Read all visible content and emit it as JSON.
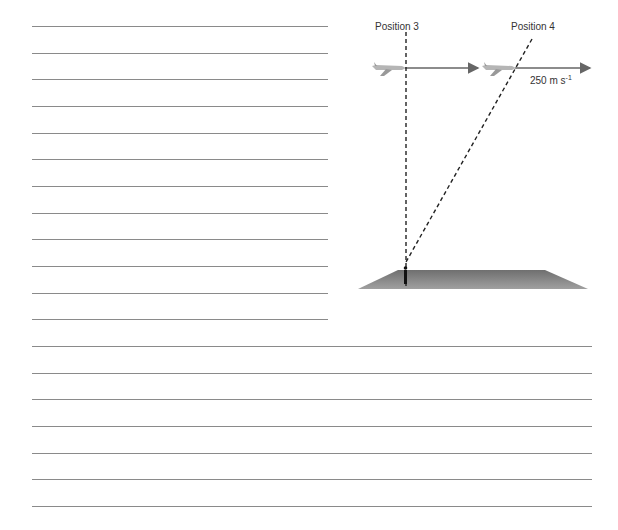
{
  "diagram": {
    "position_3_label": "Position 3",
    "position_4_label": "Position 4",
    "speed_label": "250 m s",
    "speed_exponent": "-1",
    "colors": {
      "ruling": "#8a8a8a",
      "arrow": "#666666",
      "ground": "#7a7a7a",
      "dashed": "#222222"
    }
  },
  "answer_lines": {
    "short_lines_count": 12,
    "full_lines_count": 7
  }
}
